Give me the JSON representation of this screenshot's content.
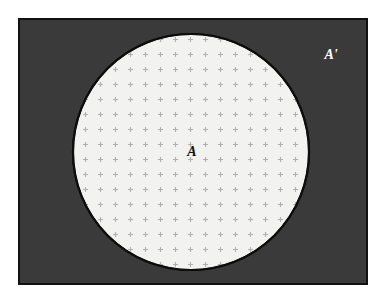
{
  "diagram": {
    "kind": "set-complement-venn-diagram",
    "universal_set": {
      "label": "A'",
      "label_name": "complement-label",
      "fill_color": "#3a3a3a",
      "stroke_color": "#111111",
      "stroke_width": 2,
      "label_color": "#ffffff",
      "label_font_size": 14,
      "rect": {
        "x": 18,
        "y": 18,
        "width": 350,
        "height": 267
      },
      "label_position": {
        "x": 331,
        "y": 56
      }
    },
    "set_a": {
      "label": "A",
      "label_name": "set-a-label",
      "fill_color": "#f2f2f0",
      "stroke_color": "#0d0d0d",
      "stroke_width": 2,
      "label_color": "#111111",
      "label_font_size": 14,
      "circle": {
        "cx": 191,
        "cy": 152,
        "r": 118
      },
      "label_position": {
        "x": 192,
        "y": 152
      }
    },
    "hatch_pattern": {
      "name": "cross-hatch-pattern",
      "glyph": "plus",
      "spacing": 15,
      "arm_length": 5,
      "stroke_color": "#b4b4b4",
      "stroke_width": 1
    },
    "canvas": {
      "width": 387,
      "height": 300,
      "background": "#ffffff"
    }
  }
}
